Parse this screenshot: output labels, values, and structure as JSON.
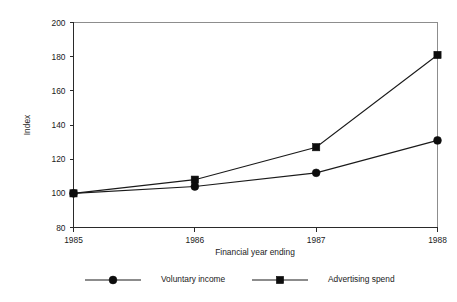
{
  "chart_data": {
    "type": "line",
    "title": "",
    "xlabel": "Financial year ending",
    "ylabel": "Index",
    "categories": [
      "1985",
      "1986",
      "1987",
      "1988"
    ],
    "x": [
      1985,
      1986,
      1987,
      1988
    ],
    "xlim": [
      1985,
      1988
    ],
    "ylim": [
      80,
      200
    ],
    "y_ticks": [
      80,
      100,
      120,
      140,
      160,
      180,
      200
    ],
    "y_tick_labels": [
      "80",
      "100",
      "120",
      "140",
      "160",
      "180",
      "200"
    ],
    "x_ticks": [
      1985,
      1986,
      1987,
      1988
    ],
    "x_tick_labels": [
      "1985",
      "1986",
      "1987",
      "1988"
    ],
    "grid": false,
    "legend_position": "bottom",
    "series": [
      {
        "name": "Voluntary income",
        "marker": "circle",
        "color": "#0d0d0d",
        "values": [
          100,
          104,
          112,
          131
        ]
      },
      {
        "name": "Advertising spend",
        "marker": "square",
        "color": "#0d0d0d",
        "values": [
          100,
          108,
          127,
          181
        ]
      }
    ]
  },
  "legend": {
    "items": [
      {
        "label": "Voluntary income",
        "marker": "circle"
      },
      {
        "label": "Advertising spend",
        "marker": "square"
      }
    ]
  },
  "axes": {
    "y_title": "Index",
    "x_title": "Financial year ending"
  }
}
